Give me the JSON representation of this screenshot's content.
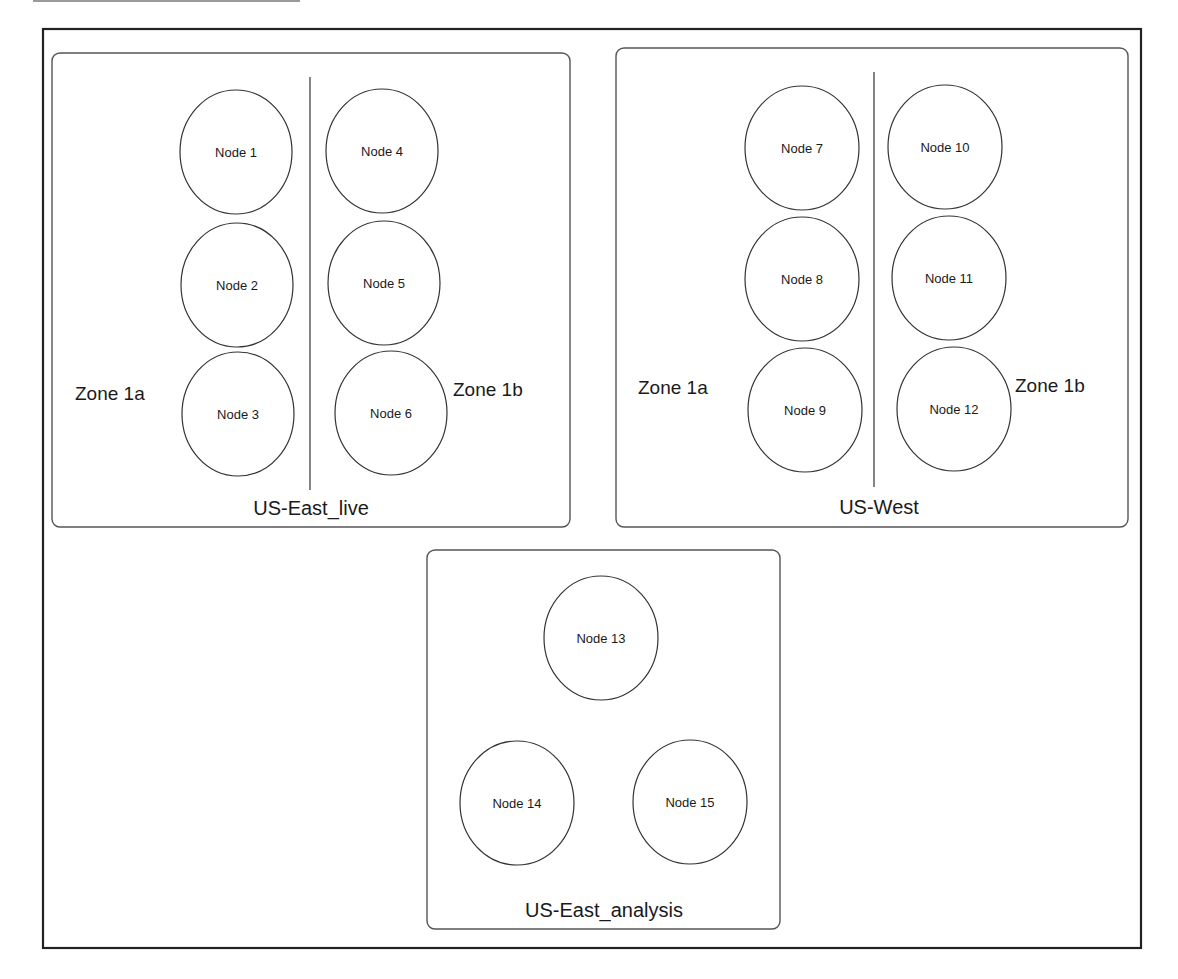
{
  "colors": {
    "background": "#ffffff",
    "frame_stroke": "#222222",
    "panel_stroke": "#555555",
    "node_stroke": "#333333",
    "text": "#1a1a1a"
  },
  "frame": {
    "x": 43,
    "y": 29,
    "w": 1098,
    "h": 919
  },
  "topbar": {
    "x1": 33,
    "x2": 300,
    "y": 1
  },
  "panels": [
    {
      "id": "us-east-live",
      "title": "US-East_live",
      "box": {
        "x": 52,
        "y": 53,
        "w": 518,
        "h": 474,
        "r": 8
      },
      "title_pos": {
        "x": 311,
        "y": 515
      },
      "divider": {
        "x": 310,
        "y1": 77,
        "y2": 490
      },
      "zones": [
        {
          "label": "Zone 1a",
          "x": 75,
          "y": 400,
          "anchor": "start"
        },
        {
          "label": "Zone 1b",
          "x": 453,
          "y": 396,
          "anchor": "start"
        }
      ],
      "nodes": [
        {
          "label": "Node 1",
          "cx": 236,
          "cy": 152,
          "rx": 56,
          "ry": 62
        },
        {
          "label": "Node 2",
          "cx": 237,
          "cy": 285,
          "rx": 56,
          "ry": 62
        },
        {
          "label": "Node 3",
          "cx": 238,
          "cy": 414,
          "rx": 56,
          "ry": 62
        },
        {
          "label": "Node 4",
          "cx": 382,
          "cy": 151,
          "rx": 56,
          "ry": 62
        },
        {
          "label": "Node 5",
          "cx": 384,
          "cy": 283,
          "rx": 56,
          "ry": 62
        },
        {
          "label": "Node 6",
          "cx": 391,
          "cy": 413,
          "rx": 56,
          "ry": 62
        }
      ]
    },
    {
      "id": "us-west",
      "title": "US-West",
      "box": {
        "x": 616,
        "y": 48,
        "w": 512,
        "h": 479,
        "r": 8
      },
      "title_pos": {
        "x": 879,
        "y": 514
      },
      "divider": {
        "x": 874,
        "y1": 72,
        "y2": 487
      },
      "zones": [
        {
          "label": "Zone 1a",
          "x": 638,
          "y": 394,
          "anchor": "start"
        },
        {
          "label": "Zone 1b",
          "x": 1015,
          "y": 392,
          "anchor": "start"
        }
      ],
      "nodes": [
        {
          "label": "Node 7",
          "cx": 802,
          "cy": 148,
          "rx": 57,
          "ry": 62
        },
        {
          "label": "Node 8",
          "cx": 802,
          "cy": 279,
          "rx": 57,
          "ry": 62
        },
        {
          "label": "Node 9",
          "cx": 805,
          "cy": 410,
          "rx": 57,
          "ry": 62
        },
        {
          "label": "Node 10",
          "cx": 945,
          "cy": 147,
          "rx": 57,
          "ry": 62
        },
        {
          "label": "Node 11",
          "cx": 949,
          "cy": 278,
          "rx": 57,
          "ry": 62
        },
        {
          "label": "Node 12",
          "cx": 954,
          "cy": 409,
          "rx": 57,
          "ry": 62
        }
      ]
    },
    {
      "id": "us-east-analysis",
      "title": "US-East_analysis",
      "box": {
        "x": 427,
        "y": 550,
        "w": 353,
        "h": 379,
        "r": 8
      },
      "title_pos": {
        "x": 604,
        "y": 917
      },
      "divider": null,
      "zones": [],
      "nodes": [
        {
          "label": "Node 13",
          "cx": 601,
          "cy": 638,
          "rx": 57,
          "ry": 62
        },
        {
          "label": "Node 14",
          "cx": 517,
          "cy": 803,
          "rx": 57,
          "ry": 62
        },
        {
          "label": "Node 15",
          "cx": 690,
          "cy": 802,
          "rx": 57,
          "ry": 62
        }
      ]
    }
  ]
}
